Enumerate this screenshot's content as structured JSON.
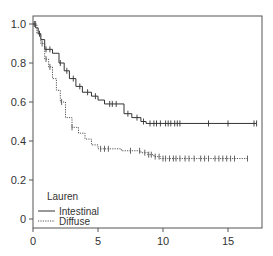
{
  "chart_data": {
    "type": "line",
    "subtype": "kaplan-meier",
    "title": "",
    "xlabel": "",
    "ylabel": "",
    "xlim": [
      0,
      17.5
    ],
    "ylim": [
      0,
      1.0
    ],
    "x_ticks": [
      0,
      5,
      10,
      15
    ],
    "x_tick_labels": [
      "0",
      "5",
      "10",
      "15"
    ],
    "y_ticks": [
      0,
      0.2,
      0.4,
      0.6,
      0.8,
      1.0
    ],
    "y_tick_labels": [
      "0",
      "0.2",
      "0.4",
      "0.6",
      "0.8",
      "1.0"
    ],
    "grid": false,
    "legend": {
      "title": "Lauren",
      "position": "lower left",
      "entries": [
        {
          "label": "Intestinal",
          "style": "solid"
        },
        {
          "label": "Diffuse",
          "style": "dotted"
        }
      ]
    },
    "series": [
      {
        "name": "Intestinal",
        "style": "solid",
        "color": "#333333",
        "steps": [
          [
            0,
            1.0
          ],
          [
            0.2,
            0.98
          ],
          [
            0.4,
            0.95
          ],
          [
            0.6,
            0.92
          ],
          [
            0.9,
            0.87
          ],
          [
            1.5,
            0.85
          ],
          [
            2.0,
            0.8
          ],
          [
            2.4,
            0.76
          ],
          [
            2.8,
            0.72
          ],
          [
            3.3,
            0.68
          ],
          [
            3.8,
            0.65
          ],
          [
            4.5,
            0.63
          ],
          [
            5.0,
            0.61
          ],
          [
            5.5,
            0.59
          ],
          [
            6.6,
            0.59
          ],
          [
            7.0,
            0.54
          ],
          [
            7.6,
            0.52
          ],
          [
            8.3,
            0.5
          ],
          [
            8.7,
            0.49
          ],
          [
            17.2,
            0.49
          ]
        ],
        "censor_x": [
          0.1,
          0.5,
          1.0,
          1.3,
          2.1,
          2.6,
          3.1,
          3.6,
          4.2,
          4.8,
          5.9,
          6.1,
          6.4,
          7.3,
          8.0,
          8.5,
          9.0,
          9.3,
          9.5,
          9.8,
          10.2,
          10.4,
          10.6,
          10.9,
          11.1,
          11.3,
          13.5,
          15.0,
          17.0,
          17.2
        ]
      },
      {
        "name": "Diffuse",
        "style": "dotted",
        "color": "#555555",
        "steps": [
          [
            0,
            1.0
          ],
          [
            0.3,
            0.95
          ],
          [
            0.6,
            0.9
          ],
          [
            0.9,
            0.82
          ],
          [
            1.2,
            0.78
          ],
          [
            1.5,
            0.72
          ],
          [
            1.8,
            0.66
          ],
          [
            2.1,
            0.6
          ],
          [
            2.5,
            0.52
          ],
          [
            3.0,
            0.47
          ],
          [
            3.5,
            0.44
          ],
          [
            4.0,
            0.41
          ],
          [
            4.5,
            0.38
          ],
          [
            5.0,
            0.36
          ],
          [
            6.3,
            0.36
          ],
          [
            6.8,
            0.35
          ],
          [
            7.6,
            0.35
          ],
          [
            8.3,
            0.34
          ],
          [
            8.8,
            0.33
          ],
          [
            9.3,
            0.32
          ],
          [
            9.8,
            0.31
          ],
          [
            16.5,
            0.31
          ]
        ],
        "censor_x": [
          0.2,
          0.7,
          1.0,
          1.3,
          2.2,
          3.0,
          5.2,
          5.5,
          5.8,
          7.5,
          8.2,
          8.6,
          8.9,
          9.1,
          9.4,
          9.7,
          10.0,
          10.2,
          10.5,
          10.8,
          11.0,
          11.3,
          11.7,
          12.0,
          12.4,
          12.9,
          13.2,
          13.5,
          14.0,
          14.3,
          14.6,
          14.9,
          15.2,
          15.5,
          16.5
        ]
      }
    ]
  }
}
